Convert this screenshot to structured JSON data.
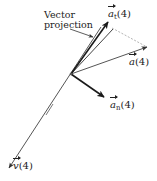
{
  "diagram": {
    "type": "vector-decomposition",
    "callout": {
      "line1": "Vector",
      "line2": "projection"
    },
    "labels": {
      "a_t": {
        "symbol": "a",
        "subscript": "t",
        "arg": "(4)"
      },
      "a": {
        "symbol": "a",
        "arg": "(4)"
      },
      "a_n": {
        "symbol": "a",
        "subscript": "n",
        "arg": "(4)"
      },
      "v": {
        "symbol": "v",
        "arg": "(4)"
      }
    },
    "colors": {
      "line": "#333333",
      "thick": "#1a1a1a",
      "dashed": "#999999",
      "text": "#222222"
    }
  }
}
